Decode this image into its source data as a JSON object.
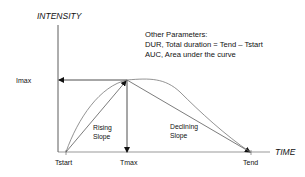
{
  "axes": {
    "y_label": "INTENSITY",
    "x_label": "TIME"
  },
  "ticks": {
    "imax": "Imax",
    "tstart": "Tstart",
    "tmax": "Tmax",
    "tend": "Tend"
  },
  "annotations": {
    "rising": [
      "Rising",
      "Slope"
    ],
    "declining": [
      "Declining",
      "Slope"
    ]
  },
  "parameters": {
    "heading": "Other Parameters:",
    "lines": [
      "DUR, Total duration = Tend – Tstart",
      "AUC, Area under the curve"
    ]
  },
  "colors": {
    "line": "#333333",
    "curve": "#777777",
    "text": "#111111"
  }
}
